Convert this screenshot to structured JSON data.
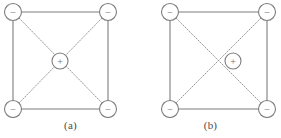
{
  "diagram": {
    "title": "",
    "background_color": "#ffffff",
    "line_color": "#7d7d7d",
    "dotted_color": "#8a8a8a",
    "circle_fill": "#ffffff",
    "circle_stroke": "#7d7d7d",
    "label_color": "#4a4a4a",
    "sign_color": "#6e6e6e",
    "panels": [
      {
        "id": "a",
        "caption": "(a)",
        "square": {
          "left": 13,
          "top": 12,
          "right": 108,
          "bottom": 109
        },
        "corner_radius": 8.5,
        "center_radius": 8,
        "corners": [
          {
            "name": "top-left",
            "sign": "−",
            "x": 13,
            "y": 12
          },
          {
            "name": "top-right",
            "sign": "−",
            "x": 108,
            "y": 12
          },
          {
            "name": "bottom-left",
            "sign": "−",
            "x": 13,
            "y": 109
          },
          {
            "name": "bottom-right",
            "sign": "−",
            "x": 108,
            "y": 109
          }
        ],
        "center_charge": {
          "name": "center-positive",
          "sign": "+",
          "x": 60,
          "y": 61
        },
        "diagonals_meet_at_center_charge": true
      },
      {
        "id": "b",
        "caption": "(b)",
        "square": {
          "left": 30,
          "top": 12,
          "right": 127,
          "bottom": 109
        },
        "corner_radius": 8.5,
        "center_radius": 8,
        "corners": [
          {
            "name": "top-left",
            "sign": "−",
            "x": 30,
            "y": 12
          },
          {
            "name": "top-right",
            "sign": "−",
            "x": 127,
            "y": 12
          },
          {
            "name": "bottom-left",
            "sign": "−",
            "x": 30,
            "y": 109
          },
          {
            "name": "bottom-right",
            "sign": "−",
            "x": 127,
            "y": 109
          }
        ],
        "center_charge": {
          "name": "offset-positive",
          "sign": "+",
          "x": 93,
          "y": 61
        },
        "diagonals_meet_at_center_charge": false
      }
    ]
  }
}
